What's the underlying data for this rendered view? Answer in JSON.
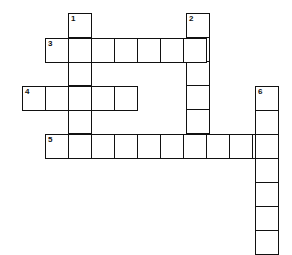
{
  "puzzle": {
    "type": "crossword",
    "cell_size": 23,
    "clues": [
      {
        "number": "1",
        "direction": "down",
        "length": 6,
        "start": {
          "x": 68,
          "y": 13
        }
      },
      {
        "number": "2",
        "direction": "down",
        "length": 6,
        "start": {
          "x": 186,
          "y": 13
        }
      },
      {
        "number": "3",
        "direction": "across",
        "length": 7,
        "start": {
          "x": 45,
          "y": 38
        }
      },
      {
        "number": "4",
        "direction": "across",
        "length": 5,
        "start": {
          "x": 22,
          "y": 86
        }
      },
      {
        "number": "5",
        "direction": "across",
        "length": 10,
        "start": {
          "x": 45,
          "y": 134
        }
      },
      {
        "number": "6",
        "direction": "down",
        "length": 7,
        "start": {
          "x": 255,
          "y": 86
        }
      }
    ],
    "colors": {
      "line": "#111111",
      "background": "#ffffff"
    }
  }
}
